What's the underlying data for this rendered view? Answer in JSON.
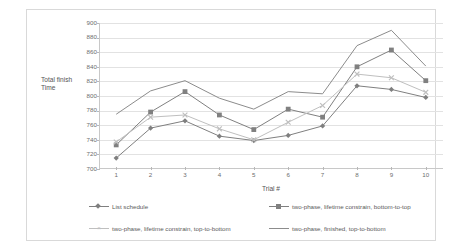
{
  "chart_data": {
    "type": "line",
    "title": "",
    "xlabel": "Trial #",
    "ylabel": "Total finish Time",
    "ylabel_line1": "Total finish",
    "ylabel_line2": "Time",
    "categories": [
      1,
      2,
      3,
      4,
      5,
      6,
      7,
      8,
      9,
      10
    ],
    "xticklabels": [
      "1",
      "2",
      "3",
      "4",
      "5",
      "6",
      "7",
      "8",
      "9",
      "10"
    ],
    "yticklabels": [
      "900",
      "880",
      "860",
      "840",
      "820",
      "800",
      "780",
      "760",
      "740",
      "720",
      "700"
    ],
    "ylim": [
      700,
      900
    ],
    "ytick_step": 20,
    "xlim": [
      1,
      10
    ],
    "grid": "horizontal",
    "legend_position": "bottom",
    "series": [
      {
        "name": "List schedule",
        "marker": "diamond",
        "color": "#7f7f7f",
        "values": [
          715,
          756,
          766,
          745,
          739,
          746,
          759,
          814,
          809,
          798
        ]
      },
      {
        "name": "two-phase, lifetime constrain, bottom-to-top",
        "marker": "square",
        "color": "#808080",
        "values": [
          733,
          778,
          806,
          774,
          754,
          782,
          771,
          840,
          863,
          821
        ]
      },
      {
        "name": "two-phase, lifetime constrain, top-to-bottom",
        "marker": "x",
        "color": "#bfbfbf",
        "values": [
          737,
          771,
          774,
          755,
          740,
          764,
          787,
          830,
          825,
          805
        ]
      },
      {
        "name": "two-phase, finished, top-to-bottom",
        "marker": "none",
        "color": "#8c8c8c",
        "values": [
          775,
          807,
          821,
          797,
          782,
          806,
          803,
          869,
          890,
          841
        ]
      }
    ]
  },
  "legend": {
    "items": [
      {
        "label": "List schedule",
        "marker": "diamond",
        "color": "#7f7f7f"
      },
      {
        "label": "two-phase, lifetime constrain, bottom-to-top",
        "marker": "square",
        "color": "#808080"
      },
      {
        "label": "two-phase, lifetime constrain, top-to-bottom",
        "marker": "x",
        "color": "#bfbfbf"
      },
      {
        "label": "two-phase, finished, top-to-bottom",
        "marker": "none",
        "color": "#8c8c8c"
      }
    ]
  }
}
